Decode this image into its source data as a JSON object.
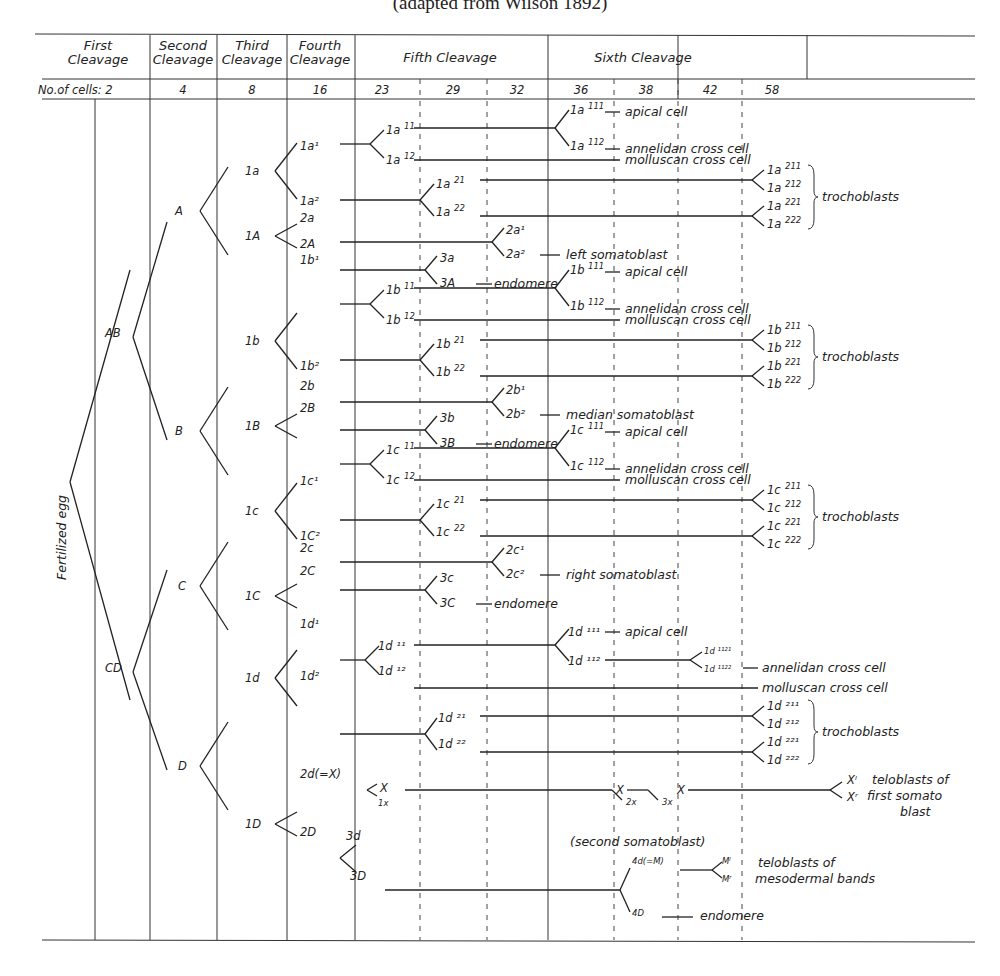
{
  "caption": "(adapted from Wilson 1892)",
  "header": {
    "cleavages": [
      "First|Cleavage",
      "Second|Cleavage",
      "Third|Cleavage",
      "Fourth|Cleavage"
    ],
    "fifth": "Fifth Cleavage",
    "sixth": "Sixth Cleavage",
    "cells_label": "No.of cells: 2",
    "cell_counts": [
      "4",
      "8",
      "16",
      "23",
      "29",
      "32",
      "36",
      "38",
      "42",
      "58"
    ]
  },
  "root_label": "Fertilized egg",
  "tree": {
    "gen2": [
      "AB",
      "CD"
    ],
    "gen4": [
      "A",
      "B",
      "C",
      "D"
    ],
    "gen8": [
      "1a",
      "1A",
      "1b",
      "1B",
      "1c",
      "1C",
      "1d",
      "1D"
    ],
    "gen16": [
      "1a¹",
      "1a²",
      "2a",
      "2A",
      "1b¹",
      "1b²",
      "2b",
      "2B",
      "1c¹",
      "1C²",
      "2c",
      "2C",
      "1d¹",
      "1d²",
      "2d(=X)",
      "2D"
    ]
  },
  "fates": {
    "apical_cell": "apical cell",
    "annelidan_cross_cell": "annelidan cross cell",
    "molluscan_cross_cell": "molluscan cross cell",
    "trochoblasts": "trochoblasts",
    "left_somatoblast": "left somatoblast",
    "median_somatoblast": "median somatoblast",
    "right_somatoblast": "right somatoblast",
    "endomere": "endomere",
    "teloblasts_first_somatoblast": [
      "teloblasts of",
      "first somato",
      "blast"
    ],
    "second_somatoblast": "(second somatoblast)",
    "teloblasts_mesodermal": [
      "teloblasts of",
      "mesodermal bands"
    ]
  },
  "quadrants": [
    {
      "q": "a",
      "y": 130,
      "sub": [
        "1a",
        "11",
        "12",
        "111",
        "112",
        "21",
        "22",
        "211",
        "212",
        "221",
        "222"
      ],
      "g2": [
        "2a",
        "2A",
        "2a¹",
        "2a²",
        "3a",
        "3A"
      ],
      "soma": "left somatoblast"
    },
    {
      "q": "b",
      "y": 290,
      "sub": [
        "1b",
        "11",
        "12",
        "111",
        "112",
        "21",
        "22",
        "211",
        "212",
        "221",
        "222"
      ],
      "g2": [
        "2b",
        "2B",
        "2b¹",
        "2b²",
        "3b",
        "3B"
      ],
      "soma": "median somatoblast"
    },
    {
      "q": "c",
      "y": 450,
      "sub": [
        "1c",
        "11",
        "12",
        "111",
        "112",
        "21",
        "22",
        "211",
        "212",
        "221",
        "222"
      ],
      "g2": [
        "2c",
        "2C",
        "2c¹",
        "2c²",
        "3c",
        "3C"
      ],
      "soma": "right somatoblast"
    }
  ],
  "d_quadrant": {
    "labels_1d": [
      "1d ¹¹",
      "1d ¹²",
      "1d ¹¹¹",
      "1d ¹¹²",
      "1d ¹¹²¹",
      "1d ¹¹²²",
      "1d ²¹",
      "1d ²²",
      "1d ²¹¹",
      "1d ²¹²",
      "1d ²²¹",
      "1d ²²²"
    ],
    "x_labels": [
      "X",
      "1x",
      "X",
      "2x",
      "X",
      "3x",
      "Xˡ",
      "Xʳ"
    ],
    "d_labels": [
      "3d",
      "3D",
      "4d(=M)",
      "4D",
      "Mˡ",
      "Mʳ"
    ]
  }
}
